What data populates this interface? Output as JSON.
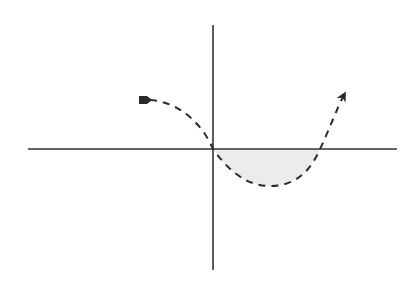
{
  "diagram": {
    "type": "function-sketch",
    "colors": {
      "background": "#ffffff",
      "axis": "#333333",
      "curve": "#2a2a2a",
      "shade": "#e8e8e8"
    },
    "axes": {
      "x_axis": {
        "x1": 28,
        "x2": 397,
        "y": 149
      },
      "y_axis": {
        "x": 213,
        "y1": 25,
        "y2": 270
      }
    },
    "curve": {
      "style": "dashed",
      "start_marker": "square-arrow-tail",
      "end_marker": "arrowhead",
      "points": [
        {
          "x": 143,
          "y": 100
        },
        {
          "x": 213,
          "y": 149
        },
        {
          "x": 270,
          "y": 186
        },
        {
          "x": 320,
          "y": 149
        },
        {
          "x": 346,
          "y": 91
        }
      ]
    },
    "shaded_region": {
      "between": "curve and x-axis",
      "x_range": [
        213,
        320
      ]
    }
  }
}
